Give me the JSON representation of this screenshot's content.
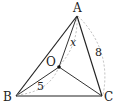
{
  "diagram": {
    "points": {
      "A": {
        "label": "A",
        "x": 77,
        "y": 16
      },
      "B": {
        "label": "B",
        "x": 16,
        "y": 96
      },
      "C": {
        "label": "C",
        "x": 102,
        "y": 96
      },
      "O": {
        "label": "O",
        "x": 59,
        "y": 67
      }
    },
    "segments": [
      "AB",
      "AC",
      "BC",
      "OA",
      "OB",
      "OC"
    ],
    "dimensions": {
      "OA": "x",
      "AC": "8",
      "OB": "5"
    },
    "colors": {
      "stroke": "#222222",
      "dashed": "#aaaaaa"
    }
  }
}
